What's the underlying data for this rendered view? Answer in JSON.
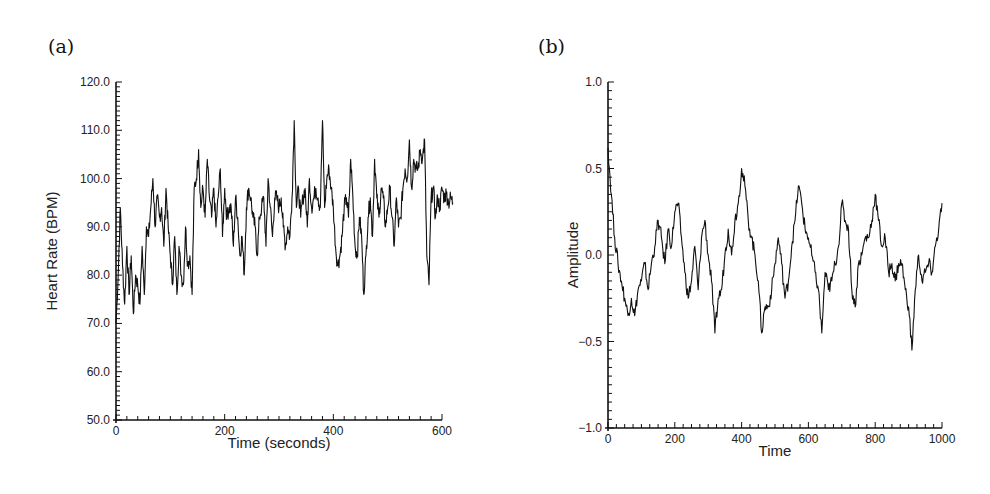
{
  "panels": [
    {
      "label": "(a)"
    },
    {
      "label": "(b)"
    }
  ],
  "chart_data": [
    {
      "type": "line",
      "panel": "(a)",
      "title": "",
      "xlabel": "Time (seconds)",
      "ylabel": "Heart Rate (BPM)",
      "xlim": [
        0,
        625
      ],
      "ylim": [
        50.0,
        120.0
      ],
      "xticks": [
        0,
        200,
        400,
        600
      ],
      "xtick_labels": [
        "0",
        "200",
        "400",
        "600"
      ],
      "yticks": [
        50.0,
        60.0,
        70.0,
        80.0,
        90.0,
        100.0,
        110.0,
        120.0
      ],
      "ytick_labels": [
        "50.0",
        "60.0",
        "70.0",
        "80.0",
        "90.0",
        "100.0",
        "110.0",
        "120.0"
      ],
      "grid": false,
      "series": [
        {
          "name": "heart rate",
          "x": [
            0,
            4,
            8,
            12,
            16,
            20,
            24,
            28,
            32,
            36,
            40,
            44,
            48,
            52,
            56,
            60,
            64,
            68,
            72,
            76,
            80,
            84,
            88,
            92,
            96,
            100,
            104,
            108,
            112,
            116,
            120,
            124,
            128,
            132,
            136,
            140,
            144,
            148,
            152,
            156,
            160,
            164,
            168,
            172,
            176,
            180,
            184,
            188,
            192,
            196,
            200,
            204,
            208,
            212,
            216,
            220,
            224,
            228,
            232,
            236,
            240,
            244,
            248,
            252,
            256,
            260,
            264,
            268,
            272,
            276,
            280,
            284,
            288,
            292,
            296,
            300,
            304,
            308,
            312,
            316,
            320,
            324,
            328,
            332,
            336,
            340,
            344,
            348,
            352,
            356,
            360,
            364,
            368,
            372,
            376,
            380,
            384,
            388,
            392,
            396,
            400,
            404,
            408,
            412,
            416,
            420,
            424,
            428,
            432,
            436,
            440,
            444,
            448,
            452,
            456,
            460,
            464,
            468,
            472,
            476,
            480,
            484,
            488,
            492,
            496,
            500,
            504,
            508,
            512,
            516,
            520,
            524,
            528,
            532,
            536,
            540,
            544,
            548,
            552,
            556,
            560,
            564,
            568,
            572,
            576,
            580,
            584,
            588,
            592,
            596,
            600,
            604,
            608,
            612,
            616,
            620
          ],
          "values": [
            70,
            80,
            94,
            82,
            74,
            86,
            76,
            84,
            72,
            80,
            78,
            74,
            86,
            76,
            90,
            88,
            94,
            100,
            90,
            96,
            92,
            94,
            86,
            98,
            90,
            84,
            78,
            88,
            76,
            86,
            80,
            78,
            90,
            82,
            84,
            76,
            98,
            100,
            106,
            94,
            98,
            92,
            104,
            96,
            92,
            98,
            90,
            96,
            102,
            88,
            98,
            92,
            94,
            94,
            86,
            96,
            92,
            84,
            88,
            80,
            94,
            98,
            96,
            92,
            90,
            84,
            92,
            94,
            96,
            86,
            100,
            94,
            88,
            96,
            96,
            94,
            96,
            90,
            86,
            90,
            88,
            96,
            112,
            94,
            98,
            92,
            96,
            98,
            90,
            100,
            94,
            96,
            98,
            96,
            94,
            112,
            94,
            100,
            102,
            98,
            94,
            86,
            82,
            84,
            88,
            94,
            96,
            92,
            104,
            96,
            86,
            84,
            92,
            88,
            76,
            84,
            92,
            96,
            88,
            104,
            96,
            92,
            98,
            96,
            90,
            94,
            98,
            92,
            86,
            96,
            90,
            92,
            98,
            102,
            100,
            108,
            98,
            104,
            102,
            102,
            106,
            104,
            108,
            84,
            78,
            96,
            98,
            92,
            96,
            94,
            98,
            96,
            97,
            95,
            96,
            95
          ],
          "note": "values approximated from image"
        }
      ]
    },
    {
      "type": "line",
      "panel": "(b)",
      "title": "",
      "xlabel": "Time",
      "ylabel": "Amplitude",
      "xlim": [
        0,
        1000
      ],
      "ylim": [
        -1.0,
        1.0
      ],
      "xticks": [
        0,
        200,
        400,
        600,
        800,
        1000
      ],
      "xtick_labels": [
        "0",
        "200",
        "400",
        "600",
        "800",
        "1000"
      ],
      "yticks": [
        -1.0,
        -0.5,
        0.0,
        0.5,
        1.0
      ],
      "ytick_labels": [
        "-1.0",
        "-0.5",
        "0.0",
        "0.5",
        "1.0"
      ],
      "grid": false,
      "series": [
        {
          "name": "amplitude",
          "x": [
            0,
            10,
            20,
            30,
            40,
            50,
            60,
            70,
            80,
            90,
            100,
            110,
            120,
            130,
            140,
            150,
            160,
            170,
            180,
            190,
            200,
            210,
            220,
            230,
            240,
            250,
            260,
            270,
            280,
            290,
            300,
            310,
            320,
            330,
            340,
            350,
            360,
            370,
            380,
            390,
            400,
            410,
            420,
            430,
            440,
            450,
            460,
            470,
            480,
            490,
            500,
            510,
            520,
            530,
            540,
            550,
            560,
            570,
            580,
            590,
            600,
            610,
            620,
            630,
            640,
            650,
            660,
            670,
            680,
            690,
            700,
            710,
            720,
            730,
            740,
            750,
            760,
            770,
            780,
            790,
            800,
            810,
            820,
            830,
            840,
            850,
            860,
            870,
            880,
            890,
            900,
            910,
            920,
            930,
            940,
            950,
            960,
            970,
            980,
            990,
            1000
          ],
          "values": [
            0.62,
            0.35,
            0.1,
            -0.05,
            -0.15,
            -0.25,
            -0.35,
            -0.25,
            -0.35,
            -0.2,
            -0.15,
            -0.05,
            -0.2,
            -0.05,
            0.05,
            0.2,
            0.1,
            -0.05,
            0.15,
            0.05,
            0.25,
            0.3,
            0.1,
            -0.1,
            -0.25,
            -0.15,
            0.05,
            -0.2,
            0.1,
            0.2,
            0.0,
            -0.15,
            -0.45,
            -0.25,
            -0.2,
            0.0,
            0.15,
            0.0,
            0.2,
            0.3,
            0.5,
            0.4,
            0.2,
            0.1,
            0.0,
            -0.15,
            -0.45,
            -0.3,
            -0.3,
            -0.2,
            -0.05,
            0.1,
            -0.05,
            -0.25,
            -0.15,
            0.05,
            0.2,
            0.4,
            0.3,
            0.15,
            0.1,
            0.0,
            -0.1,
            -0.2,
            -0.45,
            -0.1,
            -0.2,
            -0.15,
            -0.05,
            0.05,
            0.3,
            0.2,
            0.15,
            -0.2,
            -0.3,
            -0.05,
            0.0,
            0.1,
            0.1,
            0.2,
            0.35,
            0.2,
            0.05,
            0.1,
            -0.1,
            -0.05,
            -0.15,
            -0.05,
            -0.05,
            -0.2,
            -0.3,
            -0.55,
            -0.2,
            0.0,
            -0.15,
            -0.1,
            -0.05,
            -0.1,
            0.05,
            0.15,
            0.3
          ],
          "note": "values approximated from image"
        }
      ]
    }
  ]
}
